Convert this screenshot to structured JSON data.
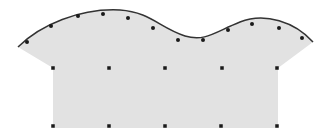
{
  "diagram": {
    "fill_color": "#e2e2e2",
    "curve_color": "#333333",
    "point_color": "#1a1a1a",
    "curve_points": [
      [
        27,
        42
      ],
      [
        51,
        26
      ],
      [
        78,
        16
      ],
      [
        103,
        14
      ],
      [
        128,
        18
      ],
      [
        153,
        28
      ],
      [
        178,
        40
      ],
      [
        203,
        40
      ],
      [
        228,
        30
      ],
      [
        252,
        24
      ],
      [
        279,
        28
      ],
      [
        302,
        38
      ]
    ],
    "grid_top_row": [
      [
        53,
        68
      ],
      [
        109,
        68
      ],
      [
        165,
        68
      ],
      [
        222,
        68
      ],
      [
        277,
        68
      ]
    ],
    "grid_bottom_row": [
      [
        53,
        126
      ],
      [
        109,
        126
      ],
      [
        165,
        126
      ],
      [
        221,
        126
      ],
      [
        277,
        126
      ]
    ]
  }
}
